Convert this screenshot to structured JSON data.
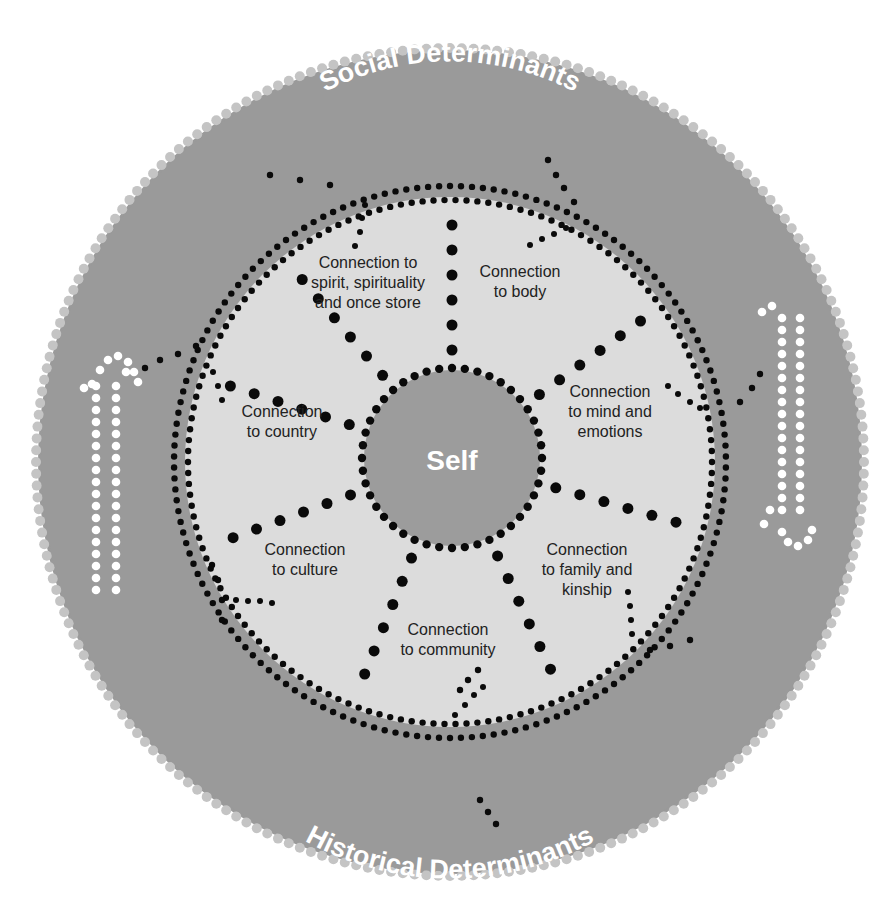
{
  "diagram": {
    "title_top": "Social Determinants",
    "title_bottom": "Historical Determinants",
    "center": "Self",
    "domains": [
      {
        "id": "spirit",
        "label": "Connection to\nspirit, spirituality\nand once store"
      },
      {
        "id": "body",
        "label": "Connection\nto body"
      },
      {
        "id": "mind",
        "label": "Connection\nto mind and\nemotions"
      },
      {
        "id": "family",
        "label": "Connection\nto family and\nkinship"
      },
      {
        "id": "community",
        "label": "Connection\nto community"
      },
      {
        "id": "culture",
        "label": "Connection\nto culture"
      },
      {
        "id": "country",
        "label": "Connection\nto country"
      }
    ],
    "colors": {
      "outer_ring": "#9a9a9a",
      "inner_disc": "#dcdcdc",
      "self_disc": "#9c9c9c",
      "dots": "#0a0a0a",
      "arrow_dots": "#ffffff",
      "text_light": "#ffffff",
      "text_dark": "#222222"
    },
    "arrows": [
      {
        "side": "left",
        "direction": "up"
      },
      {
        "side": "right",
        "direction": "down"
      }
    ]
  }
}
